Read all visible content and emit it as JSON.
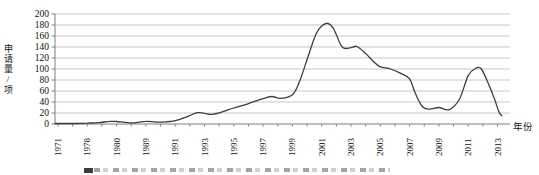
{
  "chart_data": {
    "type": "line",
    "title": "",
    "ylabel": "申请量/项",
    "xlabel": "年份",
    "ylim": [
      0,
      200
    ],
    "ytick_step": 20,
    "yticks": [
      "0",
      "20",
      "40",
      "60",
      "80",
      "100",
      "120",
      "140",
      "160",
      "180",
      "200"
    ],
    "categories": [
      "1971",
      "1978",
      "1980",
      "1989",
      "1991",
      "1993",
      "1995",
      "1997",
      "1999",
      "2001",
      "2003",
      "2005",
      "2007",
      "2009",
      "2011",
      "2013"
    ],
    "values_at_labels": [
      1,
      2,
      4,
      5,
      6,
      19,
      29,
      46,
      53,
      178,
      139,
      104,
      82,
      30,
      88,
      33
    ],
    "curve_keypoints": [
      [
        -0.1,
        1
      ],
      [
        0,
        1
      ],
      [
        0.6,
        1
      ],
      [
        1,
        1.5
      ],
      [
        1.4,
        2.5
      ],
      [
        1.75,
        4.8
      ],
      [
        2,
        4.5
      ],
      [
        2.3,
        3
      ],
      [
        2.6,
        2
      ],
      [
        3,
        5
      ],
      [
        3.35,
        3.5
      ],
      [
        3.7,
        4
      ],
      [
        4,
        6
      ],
      [
        4.4,
        13
      ],
      [
        4.75,
        20.5
      ],
      [
        5,
        19.5
      ],
      [
        5.25,
        17.5
      ],
      [
        5.6,
        22
      ],
      [
        6,
        29
      ],
      [
        6.5,
        37
      ],
      [
        7,
        46
      ],
      [
        7.3,
        50
      ],
      [
        7.6,
        46.5
      ],
      [
        8,
        53
      ],
      [
        8.25,
        78
      ],
      [
        8.55,
        125
      ],
      [
        8.8,
        163
      ],
      [
        9,
        178
      ],
      [
        9.2,
        183
      ],
      [
        9.4,
        174
      ],
      [
        9.7,
        140
      ],
      [
        10,
        139
      ],
      [
        10.2,
        141
      ],
      [
        10.5,
        128
      ],
      [
        10.8,
        112
      ],
      [
        11,
        104
      ],
      [
        11.35,
        100
      ],
      [
        11.7,
        92
      ],
      [
        12,
        82
      ],
      [
        12.2,
        55
      ],
      [
        12.45,
        31
      ],
      [
        12.7,
        27
      ],
      [
        13,
        30
      ],
      [
        13.35,
        26
      ],
      [
        13.7,
        45
      ],
      [
        14,
        88
      ],
      [
        14.25,
        101
      ],
      [
        14.45,
        100
      ],
      [
        14.7,
        72
      ],
      [
        14.9,
        45
      ],
      [
        15.05,
        22
      ],
      [
        15.15,
        15
      ]
    ],
    "annotations": {
      "max_value": 183,
      "max_near_label": "2001",
      "secondary_peak": 102,
      "secondary_peak_near_label": "2011",
      "final_value": 15
    },
    "grid": true,
    "legend": false,
    "colors": {
      "line": "#3d3d3d",
      "grid": "#b9b9b9",
      "axis": "#7f7f7f",
      "text": "#111111"
    }
  }
}
